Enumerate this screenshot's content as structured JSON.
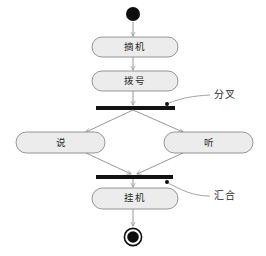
{
  "diagram": {
    "type": "uml-activity-diagram",
    "title": "",
    "colors": {
      "action_fill": "#ececed",
      "action_stroke": "#8a8a8a",
      "flow_stroke": "#8c8c8c",
      "bar_fill": "#121212",
      "node_fill": "#0d0d0d",
      "background": "#ffffff"
    },
    "nodes": {
      "initial": {
        "name": "initial-node",
        "cx": 133,
        "cy": 14,
        "r": 7
      },
      "action_pickup": {
        "label": "摘机",
        "cx": 135,
        "cy": 47,
        "w": 86,
        "h": 20
      },
      "action_dial": {
        "label": "拨号",
        "cx": 135,
        "cy": 81,
        "w": 86,
        "h": 20
      },
      "fork_bar": {
        "x": 96,
        "y": 106,
        "w": 79,
        "h": 4
      },
      "action_speak": {
        "label": "说",
        "cx": 61,
        "cy": 143,
        "w": 89,
        "h": 21
      },
      "action_listen": {
        "label": "听",
        "cx": 209,
        "cy": 143,
        "w": 89,
        "h": 21
      },
      "join_bar": {
        "x": 96,
        "y": 175,
        "w": 77,
        "h": 4
      },
      "action_hangup": {
        "label": "挂机",
        "cx": 135,
        "cy": 198,
        "w": 86,
        "h": 21
      },
      "final": {
        "name": "final-node",
        "cx": 133,
        "cy": 237,
        "r_outer": 9,
        "r_inner": 6
      }
    },
    "annotations": [
      {
        "label": "分叉",
        "x": 218,
        "y": 95,
        "anchor_x": 168,
        "anchor_y": 108
      },
      {
        "label": "汇合",
        "x": 218,
        "y": 196,
        "anchor_x": 168,
        "anchor_y": 177
      }
    ],
    "edges": [
      {
        "from": "initial",
        "to": "action_pickup"
      },
      {
        "from": "action_pickup",
        "to": "action_dial"
      },
      {
        "from": "action_dial",
        "to": "fork_bar"
      },
      {
        "from": "fork_bar",
        "to": "action_speak"
      },
      {
        "from": "fork_bar",
        "to": "action_listen"
      },
      {
        "from": "action_speak",
        "to": "join_bar"
      },
      {
        "from": "action_listen",
        "to": "join_bar"
      },
      {
        "from": "join_bar",
        "to": "action_hangup"
      },
      {
        "from": "action_hangup",
        "to": "final"
      }
    ]
  }
}
